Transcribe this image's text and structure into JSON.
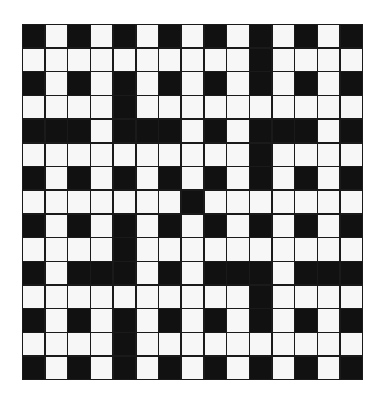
{
  "puzzle": {
    "type": "crossword",
    "rows": 15,
    "cols": 15,
    "colors": {
      "black": "#111111",
      "white": "#f7f7f7",
      "border": "#1a1a1a"
    },
    "grid": [
      "BWBWBWBWBWBWBWB",
      "WWWWWWWWWWBWWWW",
      "BWBWBWBWBWBWBWB",
      "WWWWBWWWWWWWWWW",
      "BBBWBBBWBWBBBWB",
      "WWWWWWWWWWBWWWW",
      "BWBWBWBWBWBWBWB",
      "WWWWWWWBWWWWWWW",
      "BWBWBWBWBWBWBWB",
      "WWWWBWWWWWWWWWW",
      "BWBBBWBWBBBWBBB",
      "WWWWWWWWWWBWWWW",
      "BWBWBWBWBWBWBWB",
      "WWWWBWWWWWWWWWW",
      "BWBWBWBWBWBWBWB"
    ]
  }
}
